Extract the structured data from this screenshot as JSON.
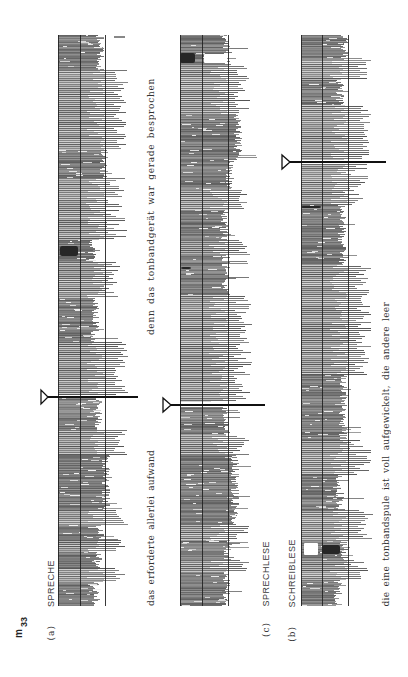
{
  "figure": {
    "id_main": "m",
    "id_sub": "33"
  },
  "panels": {
    "a": {
      "letter": "(a)",
      "title": "SPRECHE"
    },
    "c": {
      "letter": "(c)",
      "title": "SPRECHLESE"
    },
    "b": {
      "letter": "(b)",
      "title": "SCHREIBLESE"
    }
  },
  "captions": {
    "sentence_1_part_1": "das erforderte allerlei aufwand",
    "sentence_1_part_2": "denn das tonbandgerät war gerade besprochen",
    "sentence_2": "die eine tonbandspule ist voll aufgewickelt, die andere leer"
  },
  "colors": {
    "ink": "#111111",
    "frame": "#222222",
    "trace": "#7a7a7a"
  },
  "strips": [
    {
      "id": "a",
      "label": "SPRECHE",
      "left": 58,
      "mid": 80,
      "right": 105,
      "top": 35,
      "bottom": 606,
      "marker": {
        "y": 397,
        "base_x": 41,
        "apex_x": 48,
        "end_x": 138
      },
      "ticks": [
        {
          "x1": 114,
          "x2": 125,
          "y": 37
        }
      ],
      "segments": [
        {
          "type": "dense",
          "y0": 35,
          "y1": 70,
          "ext": 100
        },
        {
          "type": "bars",
          "y0": 70,
          "y1": 150,
          "min": 112,
          "max": 128
        },
        {
          "type": "dense",
          "y0": 150,
          "y1": 178,
          "ext": 104
        },
        {
          "type": "bars",
          "y0": 178,
          "y1": 240,
          "min": 106,
          "max": 127
        },
        {
          "type": "dense",
          "y0": 240,
          "y1": 262,
          "ext": 92
        },
        {
          "type": "bars",
          "y0": 262,
          "y1": 298,
          "min": 104,
          "max": 122
        },
        {
          "type": "dense",
          "y0": 298,
          "y1": 342,
          "ext": 95
        },
        {
          "type": "bars",
          "y0": 342,
          "y1": 395,
          "min": 114,
          "max": 128
        },
        {
          "type": "dense",
          "y0": 398,
          "y1": 430,
          "ext": 98
        },
        {
          "type": "bars",
          "y0": 430,
          "y1": 455,
          "min": 110,
          "max": 127
        },
        {
          "type": "dense",
          "y0": 455,
          "y1": 510,
          "ext": 106
        },
        {
          "type": "bars",
          "y0": 510,
          "y1": 525,
          "min": 114,
          "max": 128
        },
        {
          "type": "dense",
          "y0": 525,
          "y1": 540,
          "ext": 100
        },
        {
          "type": "bars",
          "y0": 540,
          "y1": 552,
          "min": 110,
          "max": 126
        },
        {
          "type": "dense",
          "y0": 552,
          "y1": 568,
          "ext": 98
        },
        {
          "type": "bars",
          "y0": 568,
          "y1": 582,
          "min": 112,
          "max": 127
        },
        {
          "type": "dense",
          "y0": 582,
          "y1": 606,
          "ext": 96
        }
      ],
      "blobs": [
        {
          "x": 60,
          "y": 246,
          "w": 18,
          "h": 10
        }
      ],
      "holes": []
    },
    {
      "id": "c",
      "label": "SPRECHLESE",
      "left": 180,
      "mid": 202,
      "right": 228,
      "top": 35,
      "bottom": 606,
      "marker": {
        "y": 405,
        "base_x": 163,
        "apex_x": 171,
        "end_x": 265
      },
      "ticks": [],
      "segments": [
        {
          "type": "dense",
          "y0": 35,
          "y1": 52,
          "ext": 226
        },
        {
          "type": "dense",
          "y0": 52,
          "y1": 65,
          "ext": 228
        },
        {
          "type": "bars",
          "y0": 65,
          "y1": 115,
          "min": 234,
          "max": 250
        },
        {
          "type": "dense",
          "y0": 115,
          "y1": 160,
          "ext": 238
        },
        {
          "type": "dense",
          "y0": 160,
          "y1": 190,
          "ext": 230
        },
        {
          "type": "bars",
          "y0": 190,
          "y1": 210,
          "min": 238,
          "max": 250
        },
        {
          "type": "dense",
          "y0": 210,
          "y1": 240,
          "ext": 224
        },
        {
          "type": "bars",
          "y0": 240,
          "y1": 255,
          "min": 235,
          "max": 250
        },
        {
          "type": "dense",
          "y0": 255,
          "y1": 295,
          "ext": 226
        },
        {
          "type": "bars",
          "y0": 295,
          "y1": 402,
          "min": 234,
          "max": 252
        },
        {
          "type": "dense",
          "y0": 407,
          "y1": 435,
          "ext": 226
        },
        {
          "type": "bars",
          "y0": 435,
          "y1": 455,
          "min": 232,
          "max": 250
        },
        {
          "type": "dense",
          "y0": 455,
          "y1": 525,
          "ext": 235
        },
        {
          "type": "bars",
          "y0": 525,
          "y1": 540,
          "min": 235,
          "max": 250
        },
        {
          "type": "dense",
          "y0": 540,
          "y1": 560,
          "ext": 228
        },
        {
          "type": "bars",
          "y0": 560,
          "y1": 572,
          "min": 235,
          "max": 250
        },
        {
          "type": "dense",
          "y0": 572,
          "y1": 606,
          "ext": 226
        }
      ],
      "blobs": [
        {
          "x": 180,
          "y": 53,
          "w": 15,
          "h": 10
        },
        {
          "x": 181,
          "y": 267,
          "w": 10,
          "h": 2
        }
      ],
      "holes": [
        {
          "x": 204,
          "y": 54,
          "w": 23,
          "h": 9
        }
      ]
    },
    {
      "id": "b",
      "label": "SCHREIBLESE",
      "left": 301,
      "mid": 322,
      "right": 348,
      "top": 35,
      "bottom": 606,
      "marker": {
        "y": 162,
        "base_x": 282,
        "apex_x": 290,
        "end_x": 386
      },
      "ticks": [],
      "segments": [
        {
          "type": "dense",
          "y0": 35,
          "y1": 60,
          "ext": 345
        },
        {
          "type": "bars",
          "y0": 60,
          "y1": 80,
          "min": 356,
          "max": 372
        },
        {
          "type": "dense",
          "y0": 80,
          "y1": 105,
          "ext": 340
        },
        {
          "type": "bars",
          "y0": 105,
          "y1": 160,
          "min": 360,
          "max": 372
        },
        {
          "type": "bars",
          "y0": 164,
          "y1": 205,
          "min": 345,
          "max": 368
        },
        {
          "type": "dense",
          "y0": 205,
          "y1": 265,
          "ext": 342
        },
        {
          "type": "bars",
          "y0": 265,
          "y1": 375,
          "min": 355,
          "max": 372
        },
        {
          "type": "dense",
          "y0": 375,
          "y1": 440,
          "ext": 343
        },
        {
          "type": "bars",
          "y0": 440,
          "y1": 475,
          "min": 350,
          "max": 372
        },
        {
          "type": "dense",
          "y0": 475,
          "y1": 510,
          "ext": 340
        },
        {
          "type": "bars",
          "y0": 510,
          "y1": 540,
          "min": 355,
          "max": 373
        },
        {
          "type": "dense",
          "y0": 540,
          "y1": 560,
          "ext": 344
        },
        {
          "type": "bars",
          "y0": 560,
          "y1": 580,
          "min": 350,
          "max": 370
        },
        {
          "type": "dense",
          "y0": 580,
          "y1": 606,
          "ext": 338
        }
      ],
      "blobs": [
        {
          "x": 322,
          "y": 545,
          "w": 18,
          "h": 9
        },
        {
          "x": 301,
          "y": 206,
          "w": 20,
          "h": 2
        }
      ],
      "holes": [
        {
          "x": 304,
          "y": 543,
          "w": 14,
          "h": 12
        }
      ]
    }
  ]
}
